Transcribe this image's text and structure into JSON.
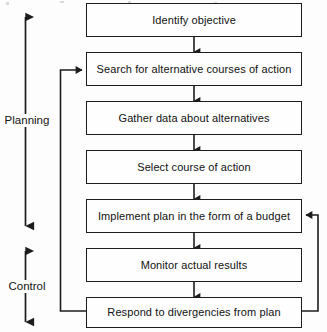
{
  "diagram": {
    "colors": {
      "stroke": "#1c1c1c",
      "box_fill": "#fefefe",
      "text": "#111111",
      "background": "#fdfdfd"
    },
    "nodes": [
      {
        "id": "identify-objective",
        "label": "Identify objective"
      },
      {
        "id": "search-alternatives",
        "label": "Search for alternative courses of action"
      },
      {
        "id": "gather-data",
        "label": "Gather data about alternatives"
      },
      {
        "id": "select-course",
        "label": "Select course of action"
      },
      {
        "id": "implement-plan",
        "label": "Implement plan in the form of a budget"
      },
      {
        "id": "monitor-results",
        "label": "Monitor actual results"
      },
      {
        "id": "respond-divergencies",
        "label": "Respond to divergencies from plan"
      }
    ],
    "brackets": [
      {
        "id": "planning",
        "label": "Planning"
      },
      {
        "id": "control",
        "label": "Control"
      }
    ],
    "connectors": [
      {
        "id": "flow-1-2",
        "kind": "down-arrow"
      },
      {
        "id": "flow-2-3",
        "kind": "down-arrow"
      },
      {
        "id": "flow-3-4",
        "kind": "down-arrow"
      },
      {
        "id": "flow-4-5",
        "kind": "down-arrow"
      },
      {
        "id": "flow-5-6",
        "kind": "down-arrow"
      },
      {
        "id": "flow-6-7",
        "kind": "down-arrow"
      },
      {
        "id": "feedback-left",
        "kind": "loop-left",
        "from": "respond-divergencies",
        "to": "search-alternatives"
      },
      {
        "id": "feedback-right",
        "kind": "loop-right",
        "from": "respond-divergencies",
        "to": "implement-plan"
      }
    ]
  }
}
